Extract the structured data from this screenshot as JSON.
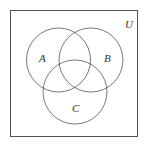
{
  "diagram": {
    "type": "venn",
    "universe_label": "U",
    "sets": [
      {
        "label": "A",
        "cx": 58.5,
        "cy": 60,
        "r": 32
      },
      {
        "label": "B",
        "cx": 91,
        "cy": 60,
        "r": 32
      },
      {
        "label": "C",
        "cx": 75,
        "cy": 92,
        "r": 32
      }
    ],
    "stroke_color": "#555555"
  }
}
